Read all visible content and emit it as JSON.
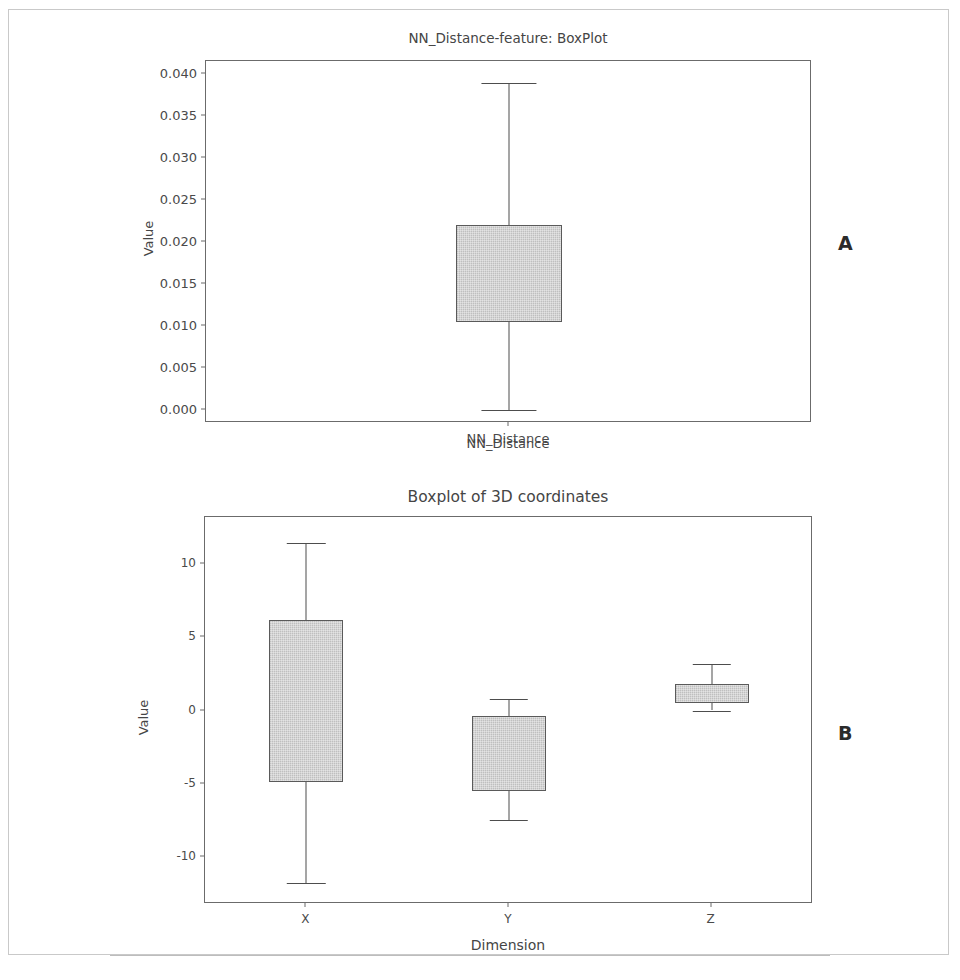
{
  "panels": [
    {
      "letter": "A"
    },
    {
      "letter": "B"
    }
  ],
  "chart_data": [
    {
      "type": "boxplot",
      "panel": "A",
      "title": "NN_Distance-feature: BoxPlot",
      "xlabel": "NN_Distance",
      "ylabel": "Value",
      "ylim": [
        -0.0015,
        0.0415
      ],
      "yticks": [
        0.0,
        0.005,
        0.01,
        0.015,
        0.02,
        0.025,
        0.03,
        0.035,
        0.04
      ],
      "ytick_labels": [
        "0.000",
        "0.005",
        "0.010",
        "0.015",
        "0.020",
        "0.025",
        "0.030",
        "0.035",
        "0.040"
      ],
      "categories": [
        "NN_Distance"
      ],
      "grid": false,
      "legend": false,
      "boxes": [
        {
          "label": "NN_Distance",
          "whisker_low": 0.0001,
          "q1": 0.0105,
          "median": 0.0155,
          "q3": 0.022,
          "whisker_high": 0.0389,
          "median_visible": false
        }
      ],
      "box_fill": "#c9c9c9",
      "box_edge": "#5a5a5a"
    },
    {
      "type": "boxplot",
      "panel": "B",
      "title": "Boxplot of 3D coordinates",
      "xlabel": "Dimension",
      "ylabel": "Value",
      "ylim": [
        -13.2,
        13.2
      ],
      "yticks": [
        -10,
        -5,
        0,
        5,
        10
      ],
      "ytick_labels": [
        "-10",
        "-5",
        "0",
        "5",
        "10"
      ],
      "categories": [
        "X",
        "Y",
        "Z"
      ],
      "grid": false,
      "legend": false,
      "boxes": [
        {
          "label": "X",
          "whisker_low": -11.8,
          "q1": -4.9,
          "median": 0.6,
          "q3": 6.2,
          "whisker_high": 11.4,
          "median_visible": false
        },
        {
          "label": "Y",
          "whisker_low": -7.5,
          "q1": -5.5,
          "median": -2.9,
          "q3": -0.4,
          "whisker_high": 0.8,
          "median_visible": false
        },
        {
          "label": "Z",
          "whisker_low": 0.0,
          "q1": 0.5,
          "median": 1.1,
          "q3": 1.8,
          "whisker_high": 3.2,
          "median_visible": false
        }
      ],
      "box_fill": "#c9c9c9",
      "box_edge": "#5a5a5a"
    }
  ]
}
